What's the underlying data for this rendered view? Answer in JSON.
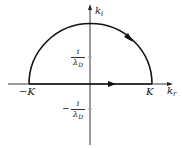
{
  "diagram": {
    "type": "complex-plane-contour",
    "axes": {
      "vertical": {
        "label_main": "k",
        "label_sub": "i"
      },
      "horizontal": {
        "label_main": "k",
        "label_sub": "r"
      }
    },
    "points": {
      "left": {
        "label": "−K"
      },
      "right": {
        "label": "K"
      },
      "upper_pole": {
        "numerator": "i",
        "denominator_main": "λ",
        "denominator_sub": "D"
      },
      "lower_pole": {
        "sign": "−",
        "numerator": "i",
        "denominator_main": "λ",
        "denominator_sub": "D"
      }
    },
    "contour": {
      "description": "closed semicircular contour in upper half-plane from −K to K along real axis, returning via arc",
      "direction": "counterclockwise"
    },
    "colors": {
      "stroke": "#111111",
      "axis": "#222222",
      "tick": "#aaaaaa",
      "background": "#ffffff"
    }
  }
}
